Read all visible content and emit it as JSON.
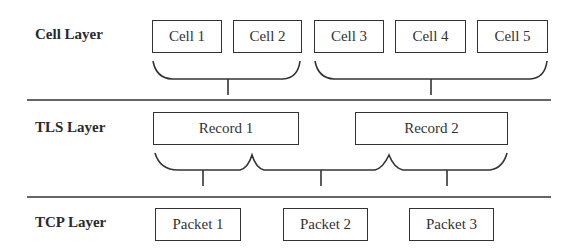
{
  "layers": [
    {
      "name": "Cell Layer",
      "units": [
        "Cell 1",
        "Cell 2",
        "Cell 3",
        "Cell 4",
        "Cell 5"
      ]
    },
    {
      "name": "TLS Layer",
      "units": [
        "Record 1",
        "Record 2"
      ]
    },
    {
      "name": "TCP Layer",
      "units": [
        "Packet 1",
        "Packet 2",
        "Packet 3"
      ]
    }
  ],
  "colors": {
    "stroke": "#333333",
    "background": "#ffffff"
  }
}
